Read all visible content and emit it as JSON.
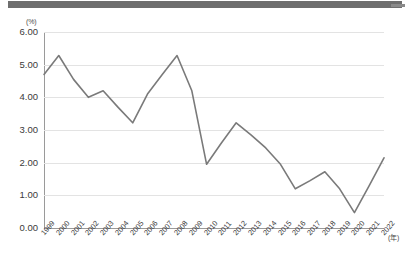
{
  "banner": {
    "name": "top-gray-bar"
  },
  "chart_data": {
    "type": "line",
    "title": "",
    "subtitle": "",
    "xlabel": "(年)",
    "ylabel": "(%)",
    "ylim": [
      0.0,
      6.0
    ],
    "yticks": [
      "0.00",
      "1.00",
      "2.00",
      "3.00",
      "4.00",
      "5.00",
      "6.00"
    ],
    "ytick_values": [
      0,
      1,
      2,
      3,
      4,
      5,
      6
    ],
    "grid": true,
    "legend": "none",
    "line_color": "#7a7a7a",
    "categories": [
      "1999",
      "2000",
      "2001",
      "2002",
      "2003",
      "2004",
      "2005",
      "2006",
      "2007",
      "2008",
      "2009",
      "2010",
      "2011",
      "2012",
      "2013",
      "2014",
      "2015",
      "2016",
      "2017",
      "2018",
      "2019",
      "2020",
      "2021",
      "2022"
    ],
    "values": [
      4.7,
      5.28,
      4.55,
      4.0,
      4.2,
      3.7,
      3.22,
      4.1,
      4.7,
      5.28,
      4.2,
      1.95,
      2.6,
      3.22,
      2.85,
      2.45,
      1.95,
      1.2,
      1.45,
      1.72,
      1.2,
      0.47,
      1.3,
      2.15
    ],
    "series": [
      {
        "name": "rate",
        "values": [
          4.7,
          5.28,
          4.55,
          4.0,
          4.2,
          3.7,
          3.22,
          4.1,
          4.7,
          5.28,
          4.2,
          1.95,
          2.6,
          3.22,
          2.85,
          2.45,
          1.95,
          1.2,
          1.45,
          1.72,
          1.2,
          0.47,
          1.3,
          2.15
        ]
      }
    ]
  }
}
